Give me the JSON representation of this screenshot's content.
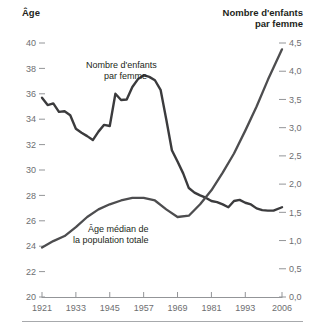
{
  "figure": {
    "left_axis_title": "Âge",
    "right_axis_title_line1": "Nombre d'enfants",
    "right_axis_title_line2": "par femme",
    "annotation_fertility_line1": "Nombre d'enfants",
    "annotation_fertility_line2": "par femme",
    "annotation_age_line1": "Âge médian de",
    "annotation_age_line2": "la population totale",
    "line_color": "#3b3b3d",
    "tick_color": "#939598",
    "text_color": "#58595b"
  },
  "axes": {
    "left_ticks": [
      "40",
      "38",
      "36",
      "34",
      "32",
      "30",
      "28",
      "26",
      "24",
      "22",
      "20"
    ],
    "right_ticks": [
      "4,5",
      "4,0",
      "3,5",
      "3,0",
      "2,5",
      "2,0",
      "1,5",
      "1,0",
      "0,5",
      "0,0"
    ],
    "x_ticks": [
      "1921",
      "1933",
      "1945",
      "1957",
      "1969",
      "1981",
      "1993",
      "2006"
    ]
  },
  "chart_data": {
    "type": "line",
    "title": "",
    "xlabel": "",
    "ylabel": "Âge",
    "y2label": "Nombre d'enfants par femme",
    "grid": false,
    "legend": "annotations-inline",
    "xlim": [
      1921,
      2006
    ],
    "ylim": [
      20,
      40
    ],
    "y2lim": [
      0.0,
      4.5
    ],
    "xticks": [
      1921,
      1933,
      1945,
      1957,
      1969,
      1981,
      1993,
      2006
    ],
    "yticks": [
      20,
      22,
      24,
      26,
      28,
      30,
      32,
      34,
      36,
      38,
      40
    ],
    "y2ticks": [
      0.0,
      0.5,
      1.0,
      1.5,
      2.0,
      2.5,
      3.0,
      3.5,
      4.0,
      4.5
    ],
    "series": [
      {
        "name": "Nombre d'enfants par femme",
        "axis": "right",
        "units": "enfants par femme",
        "x": [
          1921,
          1923,
          1925,
          1927,
          1929,
          1931,
          1933,
          1935,
          1937,
          1939,
          1941,
          1943,
          1945,
          1947,
          1949,
          1951,
          1953,
          1955,
          1957,
          1959,
          1961,
          1963,
          1965,
          1967,
          1969,
          1971,
          1973,
          1975,
          1977,
          1979,
          1981,
          1983,
          1985,
          1987,
          1989,
          1991,
          1993,
          1995,
          1997,
          1999,
          2001,
          2003,
          2006
        ],
        "values": [
          3.53,
          3.4,
          3.43,
          3.28,
          3.29,
          3.22,
          2.98,
          2.91,
          2.85,
          2.78,
          2.93,
          3.05,
          3.03,
          3.6,
          3.49,
          3.5,
          3.72,
          3.86,
          3.93,
          3.9,
          3.84,
          3.67,
          3.15,
          2.6,
          2.4,
          2.19,
          1.93,
          1.85,
          1.8,
          1.76,
          1.7,
          1.68,
          1.64,
          1.59,
          1.7,
          1.72,
          1.67,
          1.64,
          1.57,
          1.54,
          1.53,
          1.53,
          1.59
        ]
      },
      {
        "name": "Âge médian de la population totale",
        "axis": "left",
        "units": "années",
        "x": [
          1921,
          1925,
          1929,
          1933,
          1937,
          1941,
          1945,
          1949,
          1953,
          1957,
          1961,
          1965,
          1969,
          1973,
          1977,
          1981,
          1985,
          1989,
          1993,
          1997,
          2001,
          2006
        ],
        "values": [
          23.9,
          24.4,
          24.8,
          25.5,
          26.3,
          26.9,
          27.3,
          27.6,
          27.8,
          27.8,
          27.6,
          26.9,
          26.3,
          26.4,
          27.3,
          28.4,
          29.8,
          31.3,
          33.1,
          35.0,
          37.1,
          39.5
        ]
      }
    ],
    "annotations": [
      {
        "text": "Nombre d'enfants par femme",
        "series": "fertility"
      },
      {
        "text": "Âge médian de la population totale",
        "series": "median-age"
      }
    ]
  }
}
